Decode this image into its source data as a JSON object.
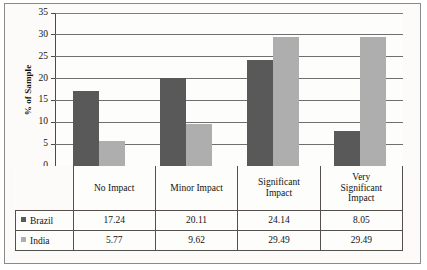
{
  "chart_data": {
    "type": "bar",
    "title": "",
    "xlabel": "",
    "ylabel": "% of Sample",
    "ylim": [
      0,
      35
    ],
    "yticks": [
      0,
      5,
      10,
      15,
      20,
      25,
      30,
      35
    ],
    "grid": true,
    "legend_position": "data-table-left",
    "categories": [
      "No Impact",
      "Minor Impact",
      "Significant Impact",
      "Very Significant Impact"
    ],
    "category_lines": [
      [
        "No Impact"
      ],
      [
        "Minor Impact"
      ],
      [
        "Significant",
        "Impact"
      ],
      [
        "Very",
        "Significant",
        "Impact"
      ]
    ],
    "series": [
      {
        "name": "Brazil",
        "color": "#595959",
        "values": [
          17.24,
          20.11,
          24.14,
          8.05
        ],
        "labels": [
          "17.24",
          "20.11",
          "24.14",
          "8.05"
        ]
      },
      {
        "name": "India",
        "color": "#aeaeae",
        "values": [
          5.77,
          9.62,
          29.49,
          29.49
        ],
        "labels": [
          "5.77",
          "9.62",
          "29.49",
          "29.49"
        ]
      }
    ]
  },
  "axis": {
    "tick_labels": [
      "35",
      "30",
      "25",
      "20",
      "15",
      "10",
      "5",
      "0"
    ],
    "y_title": "% of Sample"
  }
}
